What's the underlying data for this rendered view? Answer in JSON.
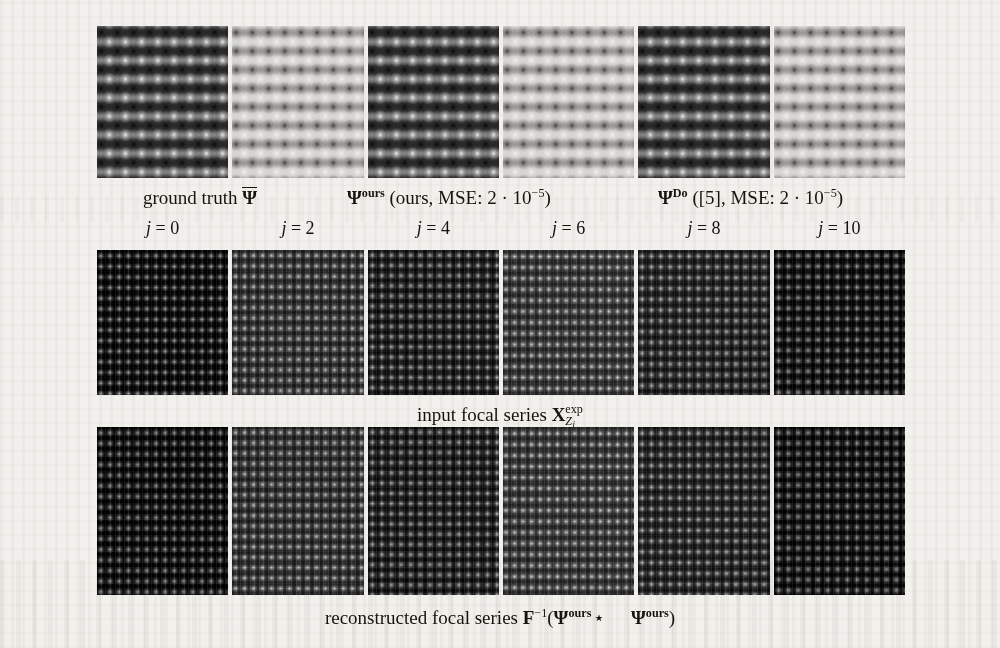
{
  "figure": {
    "type": "image-grid",
    "columns": 6,
    "rows": 3,
    "background_color": "#f2f0ec",
    "ink_color": "#17140f"
  },
  "row_top": {
    "name": "exit wave comparison",
    "tiles": [
      {
        "id": "gt-phase",
        "group": "ground truth",
        "channel": "phase",
        "tone": "dark"
      },
      {
        "id": "gt-amp",
        "group": "ground truth",
        "channel": "amplitude",
        "tone": "light"
      },
      {
        "id": "ours-phase",
        "group": "ours",
        "channel": "phase",
        "tone": "dark"
      },
      {
        "id": "ours-amp",
        "group": "ours",
        "channel": "amplitude",
        "tone": "light"
      },
      {
        "id": "do-phase",
        "group": "Do",
        "channel": "phase",
        "tone": "dark"
      },
      {
        "id": "do-amp",
        "group": "Do",
        "channel": "amplitude",
        "tone": "light"
      }
    ],
    "captions": [
      {
        "id": "caption-ground-truth",
        "lead": "ground truth",
        "symbol": "Ψ",
        "symbol_overline": true,
        "superscript": "",
        "suffix": ""
      },
      {
        "id": "caption-ours",
        "lead": "",
        "symbol": "Ψ",
        "symbol_overline": false,
        "superscript": "ours",
        "suffix": "(ours, MSE: 2 · 10",
        "mse_mantissa": "2",
        "mse_exponent": "−5",
        "method_label": "ours"
      },
      {
        "id": "caption-do",
        "lead": "",
        "symbol": "Ψ",
        "symbol_overline": false,
        "superscript": "Do",
        "suffix": "([5], MSE: 2 · 10",
        "mse_mantissa": "2",
        "mse_exponent": "−5",
        "method_label": "[5]",
        "citation": "[5]"
      }
    ]
  },
  "focal_index_labels": {
    "variable": "j",
    "equals": "=",
    "values": [
      "0",
      "2",
      "4",
      "6",
      "8",
      "10"
    ],
    "rendered": [
      "j = 0",
      "j = 2",
      "j = 4",
      "j = 6",
      "j = 8",
      "j = 10"
    ]
  },
  "row_middle": {
    "name": "input focal series",
    "caption_text": "input focal series",
    "caption_symbol": "X",
    "caption_superscript": "exp",
    "caption_subscript": "Z",
    "caption_subscript_index": "j",
    "tiles": [
      {
        "id": "input-j0",
        "j": 0,
        "tone": "dark"
      },
      {
        "id": "input-j2",
        "j": 2,
        "tone": "dark"
      },
      {
        "id": "input-j4",
        "j": 4,
        "tone": "dark"
      },
      {
        "id": "input-j6",
        "j": 6,
        "tone": "dark"
      },
      {
        "id": "input-j8",
        "j": 8,
        "tone": "dark"
      },
      {
        "id": "input-j10",
        "j": 10,
        "tone": "dark"
      }
    ]
  },
  "row_bottom": {
    "name": "reconstructed focal series",
    "caption_text": "reconstructed focal series",
    "caption_operator": "F",
    "caption_operator_exponent": "−1",
    "caption_open": "(",
    "caption_term1": "Ψ",
    "caption_term1_superscript": "ours",
    "caption_star": "⋆",
    "caption_term2": "Ψ",
    "caption_term2_superscript": "ours",
    "caption_close": ")",
    "tiles": [
      {
        "id": "recon-j0",
        "j": 0,
        "tone": "dark"
      },
      {
        "id": "recon-j2",
        "j": 2,
        "tone": "dark"
      },
      {
        "id": "recon-j4",
        "j": 4,
        "tone": "dark"
      },
      {
        "id": "recon-j6",
        "j": 6,
        "tone": "dark"
      },
      {
        "id": "recon-j8",
        "j": 8,
        "tone": "dark"
      },
      {
        "id": "recon-j10",
        "j": 10,
        "tone": "dark"
      }
    ]
  },
  "text_fragments": {
    "ground_truth": "ground truth",
    "ours_paren": "(ours, MSE: 2 · 10",
    "do_paren": "([5], MSE: 2 · 10",
    "close_paren": ")",
    "exp_minus5": "−5",
    "input_focal_series": "input focal series",
    "reconstructed_focal_series": "reconstructed focal series",
    "psi": "Ψ",
    "star": "⋆",
    "sup_ours": "ours",
    "sup_do": "Do",
    "sup_exp": "exp",
    "sup_minus1": "−1",
    "operator_F": "F",
    "operator_X": "X",
    "sub_Z": "Z",
    "sub_j": "j",
    "j_var": "j",
    "open_paren": "(",
    "j0": "j = 0",
    "j2": "j = 2",
    "j4": "j = 4",
    "j6": "j = 6",
    "j8": "j = 8",
    "j10": "j = 10"
  }
}
